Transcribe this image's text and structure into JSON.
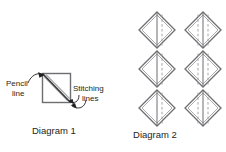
{
  "figure": {
    "background_color": "#ffffff"
  },
  "colors": {
    "outline": "#6d6e71",
    "pencil_line": "#3b3b3b",
    "stitching_line": "#a7a9ac",
    "dashed_line": "#9a9a9a",
    "text": "#231f20",
    "arrow": "#231f20"
  },
  "diagram1": {
    "caption": "Diagram 1",
    "labels": {
      "pencil": {
        "line1": "Pencil",
        "line2": "line"
      },
      "stitching": {
        "line1": "Stitching",
        "line2": "lines"
      }
    },
    "square": {
      "x": 42,
      "y": 73,
      "size": 29
    },
    "lines": [
      {
        "name": "stitching-line-upper",
        "kind": "stitching"
      },
      {
        "name": "pencil-diagonal",
        "kind": "pencil"
      },
      {
        "name": "stitching-line-lower",
        "kind": "stitching"
      }
    ]
  },
  "diagram2": {
    "caption": "Diagram 2",
    "grid": {
      "rows": 3,
      "columns": 2
    },
    "cells": [
      {
        "name": "diamond-r1c1",
        "row": 1,
        "column": 1,
        "cx": 157,
        "cy": 30,
        "dashed_lines": 1
      },
      {
        "name": "diamond-r1c2",
        "row": 1,
        "column": 2,
        "cx": 203,
        "cy": 30,
        "dashed_lines": 2
      },
      {
        "name": "diamond-r2c1",
        "row": 2,
        "column": 1,
        "cx": 157,
        "cy": 69,
        "dashed_lines": 1
      },
      {
        "name": "diamond-r2c2",
        "row": 2,
        "column": 2,
        "cx": 203,
        "cy": 69,
        "dashed_lines": 2
      },
      {
        "name": "diamond-r3c1",
        "row": 3,
        "column": 1,
        "cx": 157,
        "cy": 108,
        "dashed_lines": 1
      },
      {
        "name": "diamond-r3c2",
        "row": 3,
        "column": 2,
        "cx": 203,
        "cy": 108,
        "dashed_lines": 2
      }
    ]
  }
}
